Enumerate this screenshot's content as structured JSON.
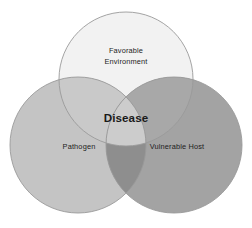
{
  "diagram": {
    "type": "venn-3-circle",
    "background_color": "#ffffff",
    "stroke_color": "#9a9a9a",
    "sets": [
      {
        "id": "environment",
        "label_line1": "Favorable",
        "label_line2": "Environment",
        "fill_color": "#f2f2f2",
        "position": "top",
        "cx": 126,
        "cy": 79,
        "r": 67,
        "label_x": 126,
        "label_y": 52
      },
      {
        "id": "pathogen",
        "label_line1": "Pathogen",
        "label_line2": "",
        "fill_color": "#c4c4c4",
        "position": "bottom-left",
        "cx": 78,
        "cy": 145,
        "r": 68,
        "label_x": 79,
        "label_y": 147
      },
      {
        "id": "host",
        "label_line1": "Vulnerable Host",
        "label_line2": "",
        "fill_color": "#a3a3a3",
        "position": "bottom-right",
        "cx": 174,
        "cy": 145,
        "r": 68,
        "label_x": 177,
        "label_y": 147
      }
    ],
    "intersections": [
      {
        "id": "env-pathogen",
        "sets": [
          "environment",
          "pathogen"
        ],
        "fill_color": "#c9c9c9"
      },
      {
        "id": "env-host",
        "sets": [
          "environment",
          "host"
        ],
        "fill_color": "#a8a8a8"
      },
      {
        "id": "pathogen-host",
        "sets": [
          "pathogen",
          "host"
        ],
        "fill_color": "#8e8e8e"
      },
      {
        "id": "center",
        "sets": [
          "environment",
          "pathogen",
          "host"
        ],
        "fill_color": "#cccccc"
      }
    ],
    "center": {
      "id": "disease",
      "label": "Disease",
      "text_color": "#1a1a1a",
      "label_x": 126,
      "label_y": 119
    }
  }
}
